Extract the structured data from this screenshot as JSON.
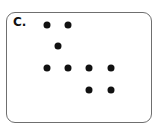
{
  "panel": {
    "label": "C.",
    "dots": [
      {
        "x": 47,
        "y": 25
      },
      {
        "x": 68,
        "y": 25
      },
      {
        "x": 58,
        "y": 46
      },
      {
        "x": 47,
        "y": 68
      },
      {
        "x": 68,
        "y": 68
      },
      {
        "x": 89,
        "y": 68
      },
      {
        "x": 111,
        "y": 68
      },
      {
        "x": 89,
        "y": 90
      },
      {
        "x": 111,
        "y": 90
      }
    ],
    "dot_color": "#111111"
  }
}
